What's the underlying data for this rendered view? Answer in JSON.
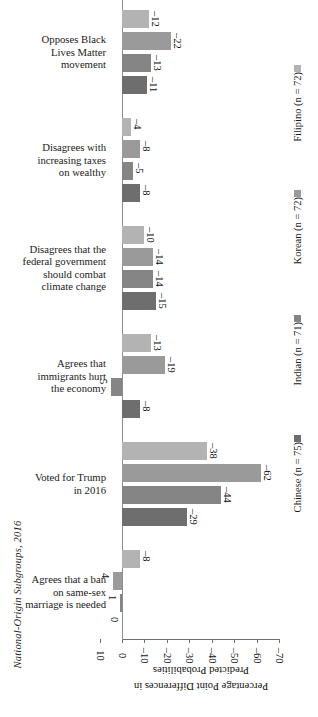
{
  "chart_data": {
    "type": "bar",
    "orientation": "horizontal",
    "title": "",
    "xlabel": "Percentage Point Differences in Predicted Probabilities",
    "ylabel": "National-Origin Subgroups, 2016",
    "xlim": [
      10,
      -70
    ],
    "xticks": [
      "10",
      "0",
      "-10",
      "-20",
      "-30",
      "-40",
      "-50",
      "-60",
      "-70"
    ],
    "xtick_values": [
      10,
      0,
      -10,
      -20,
      -30,
      -40,
      -50,
      -60,
      -70
    ],
    "grid": false,
    "legend_position": "right",
    "categories": [
      "Opposes Black Lives Matter movement",
      "Disagrees with increasing taxes on wealthy",
      "Disagrees that the federal government should combat climate change",
      "Agrees that immigrants hurt the economy",
      "Voted for Trump in 2016",
      "Agrees that a ban on same-sex marriage is needed"
    ],
    "series": [
      {
        "name": "Filipino (n = 72)",
        "color": "#b3b3b3",
        "values": [
          -12,
          -4,
          -10,
          -13,
          -38,
          -8
        ]
      },
      {
        "name": "Korean (n = 72)",
        "color": "#9a9a9a",
        "values": [
          -22,
          -8,
          -14,
          -19,
          -62,
          4
        ]
      },
      {
        "name": "Indian (n = 71)",
        "color": "#858585",
        "values": [
          -13,
          -5,
          -14,
          5,
          -44,
          1
        ]
      },
      {
        "name": "Chinese (n = 75)",
        "color": "#6e6e6e",
        "values": [
          -11,
          -8,
          -15,
          -8,
          -29,
          0
        ]
      }
    ],
    "value_labels": {
      "Opposes Black Lives Matter movement": [
        "-12",
        "-22",
        "-13",
        "-11"
      ],
      "Disagrees with increasing taxes on wealthy": [
        "-4",
        "-8",
        "-5",
        "-8"
      ],
      "Disagrees that the federal government should combat climate change": [
        "-10",
        "-14",
        "-14",
        "-15"
      ],
      "Agrees that immigrants hurt the economy": [
        "-13",
        "-19",
        "5",
        "-8"
      ],
      "Voted for Trump in 2016": [
        "-38",
        "-62",
        "-44",
        "-29"
      ],
      "Agrees that a ban on same-sex marriage is needed": [
        "-8",
        "4",
        "1",
        "0"
      ]
    }
  },
  "category_lines": [
    [
      "Opposes Black",
      "Lives Matter",
      "movement"
    ],
    [
      "Disagrees with",
      "increasing taxes",
      "on wealthy"
    ],
    [
      "Disagrees that the",
      "federal government",
      "should combat",
      "climate change"
    ],
    [
      "Agrees that",
      "immigrants hurt",
      "the economy"
    ],
    [
      "Voted for Trump",
      "in 2016"
    ],
    [
      "Agrees that a ban",
      "on same-sex",
      "marriage is needed"
    ]
  ],
  "legend": {
    "entries": [
      {
        "label": "Filipino (n = 72)",
        "color": "#b3b3b3"
      },
      {
        "label": "Korean (n = 72)",
        "color": "#9a9a9a"
      },
      {
        "label": "Indian (n = 71)",
        "color": "#858585"
      },
      {
        "label": "Chinese (n = 75)",
        "color": "#6e6e6e"
      }
    ]
  },
  "axes": {
    "value_axis_title": "Percentage Point Differences in Predicted Probabilities",
    "value_axis_title_line1": "Percentage Point Differences in",
    "value_axis_title_line2": "Predicted Probabilities",
    "category_axis_title": "National-Origin Subgroups, 2016",
    "ticks": [
      "10",
      "0",
      "-10",
      "-20",
      "-30",
      "-40",
      "-50",
      "-60",
      "-70"
    ]
  },
  "colors": {
    "axis": "#6f6f6f",
    "zero_line": "#8d8d8d",
    "text": "#1a1a1a",
    "background": "#ffffff"
  }
}
